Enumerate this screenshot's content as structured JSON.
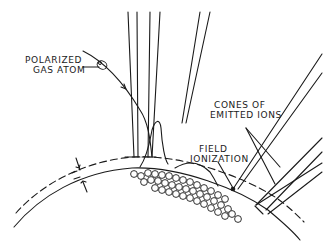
{
  "diagram": {
    "ink_color": "#1a1a1a",
    "background_color": "#ffffff",
    "labels": {
      "polarized_line1": "POLARIZED",
      "polarized_line2": "GAS ATOM",
      "cones_line1": "CONES OF",
      "cones_line2": "EMITTED  IONS",
      "field_line1": "FIELD",
      "field_line2": "IONIZATION"
    },
    "elements": [
      "curved-tip-surface",
      "dashed-ionization-zone-boundary",
      "gap-dimension-arrows",
      "surface-atom-spheres",
      "gas-atom-trajectory",
      "polarized-gas-atom",
      "vertical-ion-cone",
      "angled-ion-cones"
    ]
  }
}
